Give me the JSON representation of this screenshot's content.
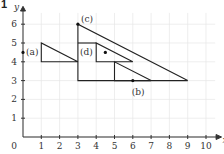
{
  "question_number": "1",
  "axes": {
    "x_label": "x",
    "y_label": "y",
    "origin_label": "0",
    "x_ticks": [
      "1",
      "2",
      "3",
      "4",
      "5",
      "6",
      "7",
      "8",
      "9",
      "10"
    ],
    "y_ticks": [
      "1",
      "2",
      "3",
      "4",
      "5",
      "6"
    ]
  },
  "labels": {
    "a": "(a)",
    "b": "(b)",
    "c": "(c)",
    "d": "(d)"
  },
  "shapes": [
    {
      "name": "triangle-a",
      "points": [
        [
          1,
          4
        ],
        [
          1,
          5
        ],
        [
          3,
          4
        ]
      ]
    },
    {
      "name": "triangle-c",
      "points": [
        [
          3,
          6
        ],
        [
          3,
          3
        ],
        [
          9,
          3
        ]
      ]
    },
    {
      "name": "line-y5",
      "points": [
        [
          3,
          5
        ],
        [
          4,
          5
        ]
      ]
    },
    {
      "name": "triangle-d",
      "points": [
        [
          4,
          5
        ],
        [
          4,
          4
        ],
        [
          6,
          4
        ]
      ]
    },
    {
      "name": "triangle-b",
      "points": [
        [
          5,
          4
        ],
        [
          5,
          3
        ],
        [
          7,
          3
        ]
      ]
    }
  ],
  "points": [
    {
      "name": "a",
      "x": 0,
      "y": 4.5
    },
    {
      "name": "b",
      "x": 6,
      "y": 3
    },
    {
      "name": "c",
      "x": 3,
      "y": 6
    },
    {
      "name": "d",
      "x": 4.5,
      "y": 4.5
    }
  ]
}
